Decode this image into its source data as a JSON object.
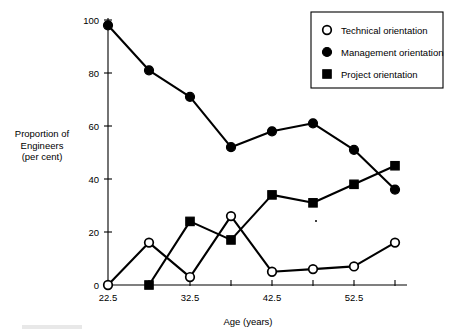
{
  "chart_data": {
    "type": "line",
    "title": "",
    "xlabel": "Age (years)",
    "ylabel": "Proportion of Engineers (per cent)",
    "x": [
      22.5,
      27.5,
      32.5,
      37.5,
      42.5,
      47.5,
      52.5,
      57.5
    ],
    "xlim": [
      22.5,
      57.5
    ],
    "ylim": [
      0,
      100
    ],
    "xticks": [
      22.5,
      27.5,
      32.5,
      37.5,
      42.5,
      47.5,
      52.5,
      57.5
    ],
    "xticklabels": [
      "22.5",
      "",
      "32.5",
      "",
      "42.5",
      "",
      "52.5",
      ""
    ],
    "yticks": [
      0,
      20,
      40,
      60,
      80,
      100
    ],
    "yticklabels": [
      "0",
      "20",
      "40",
      "60",
      "80",
      "100"
    ],
    "grid": false,
    "legend_position": "top-right",
    "series": [
      {
        "name": "Technical orientation",
        "marker": "open-circle",
        "values": [
          0,
          16,
          3,
          26,
          5,
          6,
          7,
          16
        ]
      },
      {
        "name": "Management orientation",
        "marker": "filled-circle",
        "values": [
          98,
          81,
          71,
          52,
          58,
          61,
          51,
          36
        ]
      },
      {
        "name": "Project orientation",
        "marker": "filled-square",
        "values": [
          null,
          0,
          24,
          17,
          34,
          31,
          38,
          45
        ]
      }
    ]
  },
  "axes": {
    "y_label_lines": [
      "Proportion of",
      "Engineers",
      "(per cent)"
    ],
    "x_label": "Age (years)"
  },
  "legend": {
    "items": [
      {
        "label": "Technical orientation",
        "marker": "open-circle"
      },
      {
        "label": "Management orientation",
        "marker": "filled-circle"
      },
      {
        "label": "Project orientation",
        "marker": "filled-square"
      }
    ]
  },
  "colors": {
    "ink": "#000000",
    "paper": "#ffffff"
  }
}
